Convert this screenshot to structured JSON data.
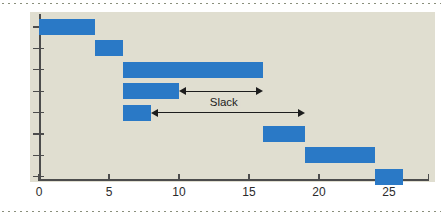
{
  "chart_data": {
    "type": "bar",
    "orientation": "horizontal",
    "subtype": "gantt",
    "title": "",
    "xlabel": "",
    "ylabel": "",
    "xlim": [
      0,
      27.85
    ],
    "xticks": [
      0,
      5,
      10,
      15,
      20,
      25
    ],
    "xtick_labels": [
      "0",
      "5",
      "10",
      "15",
      "20",
      "25"
    ],
    "grid": false,
    "legend": false,
    "bar_color": "#2a79c6",
    "panel_color": "#e0ded0",
    "axis_color": "#4c4c4c",
    "categories": [
      "A1",
      "A2",
      "A3",
      "A4",
      "A5",
      "A6",
      "A7",
      "A8"
    ],
    "category_labels": [
      "A",
      "A",
      "A",
      "A",
      "A",
      "A",
      "A",
      "A"
    ],
    "category_subscripts": [
      "1",
      "2",
      "3",
      "4",
      "5",
      "6",
      "7",
      "8"
    ],
    "tasks": [
      {
        "name": "A",
        "sub": "1",
        "start": 0,
        "end": 4,
        "duration": 4
      },
      {
        "name": "A",
        "sub": "2",
        "start": 4,
        "end": 6,
        "duration": 2
      },
      {
        "name": "A",
        "sub": "3",
        "start": 6,
        "end": 16,
        "duration": 10
      },
      {
        "name": "A",
        "sub": "4",
        "start": 6,
        "end": 10,
        "duration": 4
      },
      {
        "name": "A",
        "sub": "5",
        "start": 6,
        "end": 8,
        "duration": 2
      },
      {
        "name": "A",
        "sub": "6",
        "start": 16,
        "end": 19,
        "duration": 3
      },
      {
        "name": "A",
        "sub": "7",
        "start": 19,
        "end": 24,
        "duration": 5
      },
      {
        "name": "A",
        "sub": "8",
        "start": 24,
        "end": 26,
        "duration": 2
      }
    ],
    "annotations": [
      {
        "label": "Slack",
        "row": 3,
        "from": 10,
        "to": 16,
        "label_at": 13.2,
        "show_label": true
      },
      {
        "label": "",
        "row": 4,
        "from": 8,
        "to": 19,
        "label_at": 13.5,
        "show_label": false
      }
    ]
  }
}
